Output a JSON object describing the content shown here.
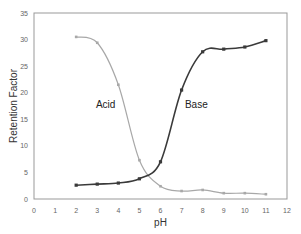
{
  "chart_data": {
    "type": "line",
    "title": "",
    "xlabel": "pH",
    "ylabel": "Retention Factor",
    "xlim": [
      0,
      12
    ],
    "ylim": [
      0,
      35
    ],
    "xticks": [
      0,
      1,
      2,
      3,
      4,
      5,
      6,
      7,
      8,
      9,
      10,
      11,
      12
    ],
    "yticks": [
      0,
      5,
      10,
      15,
      20,
      25,
      30,
      35
    ],
    "grid": false,
    "legend": "none (inline annotations)",
    "x": [
      2,
      3,
      4,
      5,
      6,
      7,
      8,
      9,
      10,
      11
    ],
    "series": [
      {
        "name": "Acid",
        "color": "#a8a8a8",
        "values": [
          30.5,
          29.4,
          21.5,
          7.3,
          2.4,
          1.5,
          1.7,
          1.1,
          1.1,
          0.9
        ]
      },
      {
        "name": "Base",
        "color": "#3a3a3a",
        "values": [
          2.6,
          2.8,
          3.0,
          3.8,
          7.0,
          20.5,
          27.7,
          28.2,
          28.6,
          29.8
        ]
      }
    ],
    "annotations": [
      {
        "text": "Acid",
        "x": 3.4,
        "y": 17.2
      },
      {
        "text": "Base",
        "x": 7.7,
        "y": 17.2
      }
    ]
  },
  "labels": {
    "xlabel": "pH",
    "ylabel": "Retention Factor",
    "acid": "Acid",
    "base": "Base"
  }
}
